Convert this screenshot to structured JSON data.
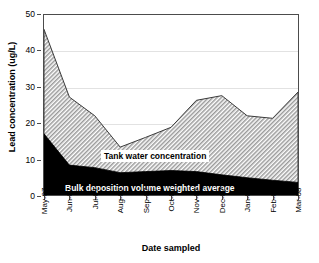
{
  "chart_data": {
    "type": "area",
    "title": "",
    "xlabel": "Date sampled",
    "ylabel": "Lead concentration (ug/L)",
    "categories": [
      "May-07",
      "Jun-07",
      "Jul-07",
      "Aug-07",
      "Sep-07",
      "Oct-07",
      "Nov-07",
      "Dec-07",
      "Jan-08",
      "Feb-08",
      "Mar-08"
    ],
    "ylim": [
      0,
      50
    ],
    "yticks": [
      0,
      10,
      20,
      30,
      40,
      50
    ],
    "grid": true,
    "legend_position": "inline-annotations",
    "stacked": false,
    "series": [
      {
        "name": "Tank water concentration",
        "fill": "hatched-gray",
        "values": [
          46.0,
          27.2,
          22.0,
          13.3,
          16.0,
          18.8,
          26.3,
          27.6,
          22.0,
          21.3,
          28.6
        ]
      },
      {
        "name": "Bulk deposition volume weighted average",
        "fill": "black",
        "values": [
          17.0,
          8.3,
          7.6,
          6.2,
          6.5,
          6.8,
          6.5,
          5.6,
          4.8,
          4.1,
          3.5
        ]
      }
    ],
    "annotations": [
      {
        "text": "Tank water concentration",
        "region": "upper-band"
      },
      {
        "text": "Bulk deposition volume weighted average",
        "region": "lower-band"
      }
    ],
    "colors": {
      "upper_band": "#b4b4b4",
      "lower_band": "#000000",
      "axis": "#4c4c4c",
      "grid": "#e2e2e2",
      "background": "#ffffff"
    }
  },
  "axes": {
    "y_title": "Lead concentration (ug/L)",
    "x_title": "Date sampled",
    "y_tick_labels": [
      "50",
      "40",
      "30",
      "20",
      "10",
      "0"
    ],
    "x_tick_labels": [
      "May-07",
      "Jun-07",
      "Jul-07",
      "Aug-07",
      "Sep-07",
      "Oct-07",
      "Nov-07",
      "Dec-07",
      "Jan-08",
      "Feb-08",
      "Mar-08"
    ]
  },
  "labels": {
    "tank": "Tank water concentration",
    "bulk": "Bulk deposition volume weighted average"
  }
}
